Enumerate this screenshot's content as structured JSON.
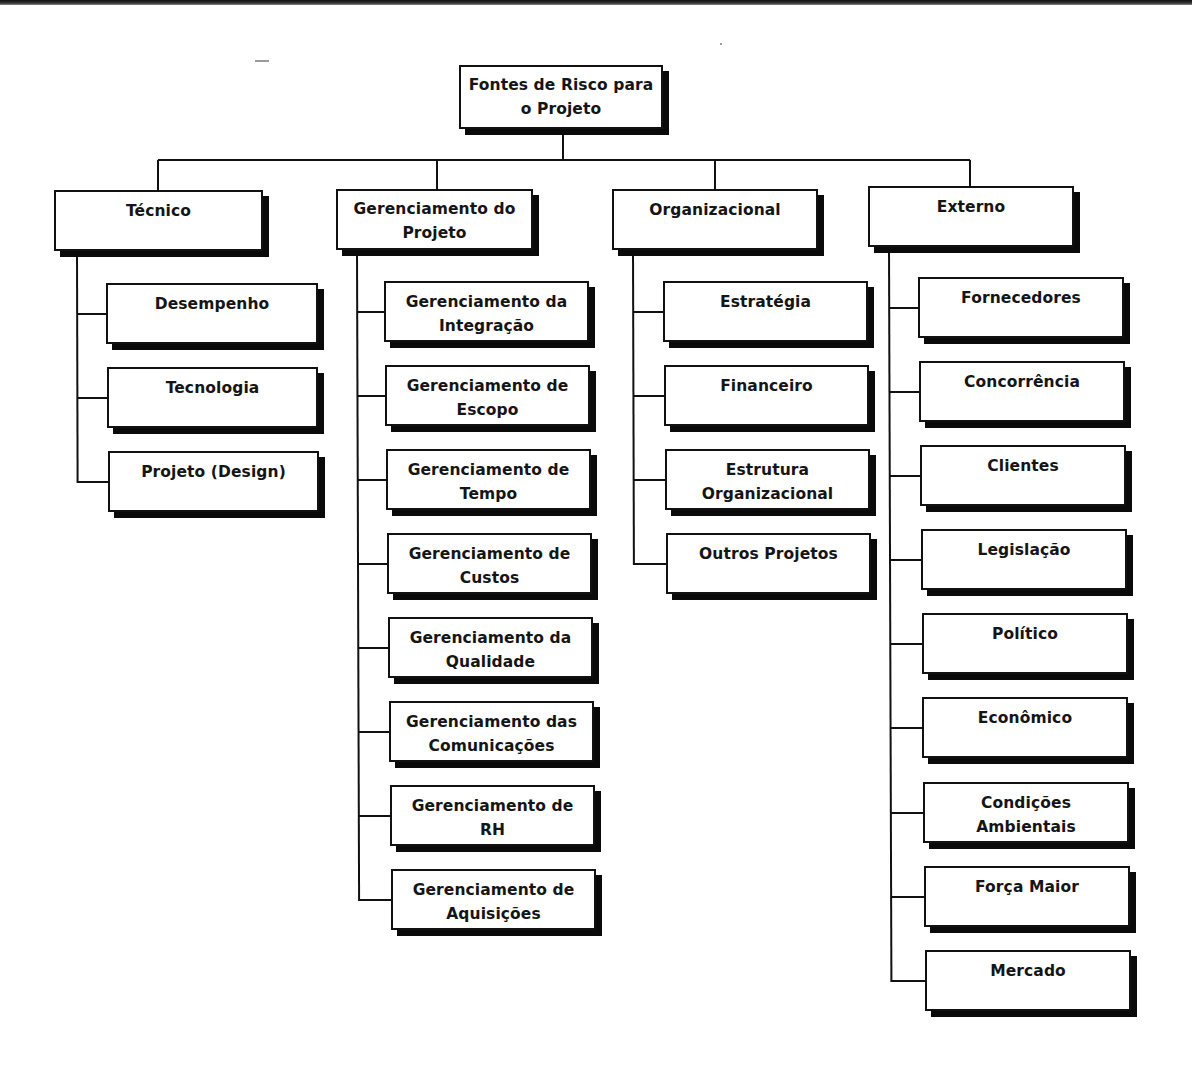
{
  "diagram": {
    "type": "hierarchy / risk breakdown structure",
    "root": {
      "label": "Fontes de Risco para\no Projeto"
    },
    "categories": [
      {
        "label": "Técnico",
        "children": [
          "Desempenho",
          "Tecnologia",
          "Projeto (Design)"
        ]
      },
      {
        "label": "Gerenciamento do\nProjeto",
        "children": [
          "Gerenciamento da\nIntegração",
          "Gerenciamento de\nEscopo",
          "Gerenciamento de\nTempo",
          "Gerenciamento de\nCustos",
          "Gerenciamento da\nQualidade",
          "Gerenciamento das\nComunicações",
          "Gerenciamento de\nRH",
          "Gerenciamento de\nAquisições"
        ]
      },
      {
        "label": "Organizacional",
        "children": [
          "Estratégia",
          "Financeiro",
          "Estrutura\nOrganizacional",
          "Outros Projetos"
        ]
      },
      {
        "label": "Externo",
        "children": [
          "Fornecedores",
          "Concorrência",
          "Clientes",
          "Legislação",
          "Político",
          "Econômico",
          "Condições\nAmbientais",
          "Força Maior",
          "Mercado"
        ]
      }
    ]
  },
  "colors": {
    "box_fill": "#ffffff",
    "box_border": "#111111",
    "shadow": "#0a0a0a",
    "connector": "#111111",
    "text": "#151515"
  }
}
